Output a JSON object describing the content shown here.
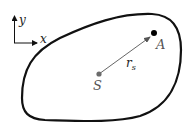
{
  "diagram": {
    "axes": {
      "x_label": "x",
      "y_label": "y"
    },
    "region": {
      "description": "closed smooth boundary"
    },
    "points": {
      "source": {
        "label": "S",
        "color": "#6b6b6b"
      },
      "observer": {
        "label": "A",
        "color": "#000000"
      }
    },
    "vector": {
      "label_main": "r",
      "label_sub": "s",
      "color": "#555555"
    }
  }
}
